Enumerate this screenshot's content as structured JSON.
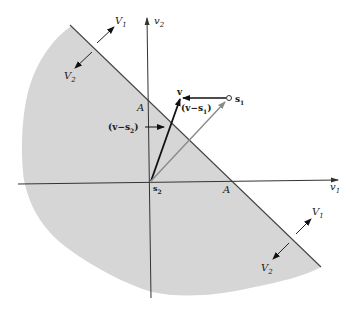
{
  "figure": {
    "colors": {
      "region_fill": "#d6d6d6",
      "axis": "#333333",
      "boundary": "#444444",
      "vector_dark": "#111111",
      "vector_gray": "#8a8a8a"
    },
    "axes": {
      "horizontal_label": "v",
      "horizontal_sub": "1",
      "vertical_label": "v",
      "vertical_sub": "2"
    },
    "origin_label": {
      "text": "s",
      "sub": "2"
    },
    "point_s1": {
      "text": "s",
      "sub": "1"
    },
    "point_v": {
      "text": "v"
    },
    "intercept_labels": {
      "on_v2_axis": "A",
      "on_v1_axis": "A"
    },
    "vector_labels": {
      "v_minus_s1": {
        "open": "(v−s",
        "sub": "1",
        "close": ")"
      },
      "v_minus_s2": {
        "open": "(v−s",
        "sub": "2",
        "close": ")"
      }
    },
    "region_labels": {
      "upper_left": {
        "V1": "V",
        "V1_sub": "1",
        "V2": "V",
        "V2_sub": "2"
      },
      "lower_right": {
        "V1": "V",
        "V1_sub": "1",
        "V2": "V",
        "V2_sub": "2"
      }
    }
  }
}
